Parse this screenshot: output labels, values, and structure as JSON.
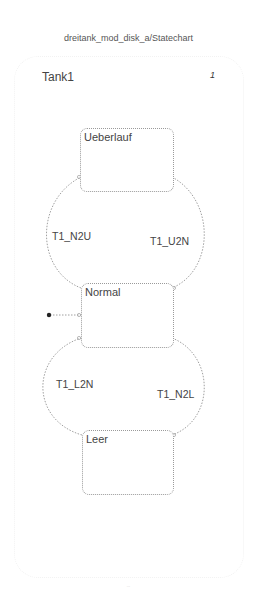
{
  "header": {
    "title": "dreitank_mod_disk_a/Statechart"
  },
  "chart": {
    "name": "Tank1",
    "marker": "1",
    "states": [
      {
        "label": "Ueberlauf"
      },
      {
        "label": "Normal"
      },
      {
        "label": "Leer"
      }
    ],
    "transitions": [
      {
        "label": "T1_N2U"
      },
      {
        "label": "T1_U2N"
      },
      {
        "label": "T1_L2N"
      },
      {
        "label": "T1_N2L"
      }
    ]
  },
  "footer": {
    "text": "..."
  }
}
